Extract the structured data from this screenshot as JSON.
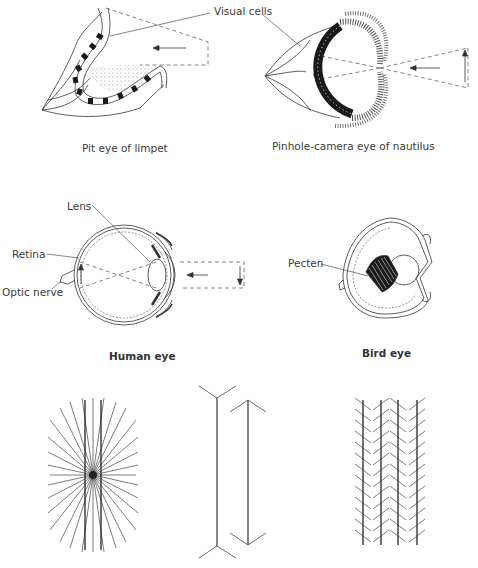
{
  "figures": {
    "limpet": {
      "caption": "Pit eye of limpet"
    },
    "nautilus": {
      "caption": "Pinhole-camera eye of nautilus"
    },
    "human": {
      "caption": "Human eye",
      "labels": {
        "lens": "Lens",
        "retina": "Retina",
        "optic_nerve": "Optic nerve"
      }
    },
    "bird": {
      "caption": "Bird eye",
      "labels": {
        "pecten": "Pecten"
      }
    }
  },
  "labels": {
    "visual_cells": "Visual cells"
  },
  "illusions": [
    {
      "name": "hering-illusion",
      "description": "Two parallel vertical lines over radiating lines"
    },
    {
      "name": "muller-lyer-illusion",
      "description": "Two vertical lines with outward and inward fins"
    },
    {
      "name": "zollner-illusion",
      "description": "Four parallel vertical lines with oblique hatches"
    }
  ],
  "colors": {
    "line": "#333333",
    "dark_fill": "#1a1a1a",
    "dash": "#666666"
  }
}
